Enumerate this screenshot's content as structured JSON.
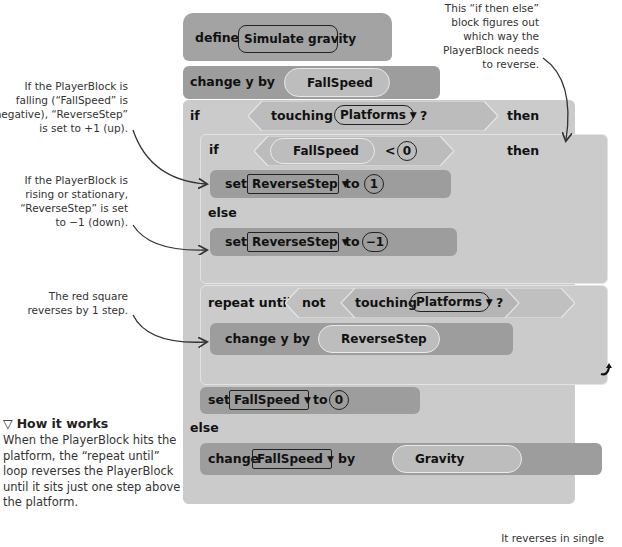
{
  "script": {
    "define": {
      "keyword": "define",
      "name": "Simulate gravity"
    },
    "change_y_fall": {
      "label": "change y by",
      "value": "FallSpeed"
    },
    "outer_if": {
      "if_label": "if",
      "touching": "touching",
      "sprite": "Platforms",
      "question": "?",
      "then_label": "then",
      "else_label": "else"
    },
    "inner_if": {
      "if_label": "if",
      "variable": "FallSpeed",
      "operator": "<",
      "operand": "0",
      "then_label": "then",
      "else_label": "else"
    },
    "set_reverse_up": {
      "set": "set",
      "variable": "ReverseStep",
      "to": "to",
      "value": "1"
    },
    "set_reverse_down": {
      "set": "set",
      "variable": "ReverseStep",
      "to": "to",
      "value": "−1"
    },
    "repeat_until": {
      "label": "repeat until",
      "not": "not",
      "touching": "touching",
      "sprite": "Platforms",
      "question": "?"
    },
    "change_y_reverse": {
      "label": "change y by",
      "value": "ReverseStep"
    },
    "set_fallspeed": {
      "set": "set",
      "variable": "FallSpeed",
      "to": "to",
      "value": "0"
    },
    "change_fallspeed": {
      "change": "change",
      "variable": "FallSpeed",
      "by": "by",
      "value": "Gravity"
    }
  },
  "annotations": {
    "if_then_else": [
      "This “if then else”",
      "block figures out",
      "which way the",
      "PlayerBlock needs",
      "to reverse."
    ],
    "falling": [
      "If the PlayerBlock is",
      "falling (“FallSpeed” is",
      "negative), “ReverseStep”",
      "is set to +1 (up)."
    ],
    "rising": [
      "If the PlayerBlock is",
      "rising or stationary,",
      "“ReverseStep” is set",
      "to −1 (down)."
    ],
    "red_square": [
      "The red square",
      "reverses by 1 step."
    ],
    "single_steps": [
      "It reverses in single"
    ]
  },
  "how_it_works": {
    "icon": "▽",
    "title": "How it works",
    "body": [
      "When the PlayerBlock hits the",
      "platform, the “repeat until”",
      "loop reverses the PlayerBlock",
      "until it sits just one step above",
      "the platform."
    ]
  },
  "colors": {
    "hat_block": "#a3a3a3",
    "motion_block": "#9d9d9d",
    "control_block": "#cbcbcb",
    "sensing_block": "#b9b9b9",
    "arrow": "#333333"
  }
}
